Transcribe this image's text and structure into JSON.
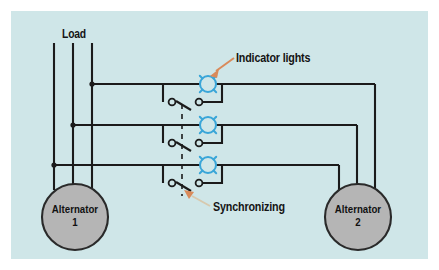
{
  "figure": {
    "kind": "electrical-schematic",
    "title_visible": false,
    "panel_background": "#cfe6e8",
    "outer_background": "#ffffff",
    "wire_color": "#1b1b1b",
    "lamp_color": "#3aa6d8",
    "callout_color": "#d98a5a",
    "machine_fill": "#b5b5b5",
    "machine_stroke": "#2a2a2a"
  },
  "labels": {
    "load": "Load",
    "indicator_lights": "Indicator lights",
    "synchronizing": "Synchronizing"
  },
  "machines": [
    {
      "id": "alternator-1",
      "name": "Alternator",
      "number": "1",
      "cx": 75,
      "cy": 217,
      "r": 33
    },
    {
      "id": "alternator-2",
      "name": "Alternator",
      "number": "2",
      "cx": 358,
      "cy": 217,
      "r": 33
    }
  ],
  "buses": [
    {
      "id": "phase-1",
      "y": 84,
      "left_x": 92,
      "right_x": 375
    },
    {
      "id": "phase-2",
      "y": 125,
      "left_x": 73,
      "right_x": 357
    },
    {
      "id": "phase-3",
      "y": 165,
      "left_x": 54,
      "right_x": 339
    }
  ],
  "left_feeders": [
    {
      "id": "load-line-1",
      "x": 54,
      "y_top": 43,
      "y_bottom": 190
    },
    {
      "id": "load-line-2",
      "x": 73,
      "y_top": 43,
      "y_bottom": 190
    },
    {
      "id": "load-line-3",
      "x": 92,
      "y_top": 43,
      "y_bottom": 190
    }
  ],
  "lamps": [
    {
      "id": "indicator-lamp-1",
      "cx": 208,
      "cy": 84,
      "r": 8
    },
    {
      "id": "indicator-lamp-2",
      "cx": 208,
      "cy": 125,
      "r": 8
    },
    {
      "id": "indicator-lamp-3",
      "cx": 208,
      "cy": 165,
      "r": 8
    }
  ],
  "switches": [
    {
      "id": "sync-switch-1",
      "left_cx": 173,
      "right_cx": 193,
      "cy": 102
    },
    {
      "id": "sync-switch-2",
      "left_cx": 173,
      "right_cx": 193,
      "cy": 143
    },
    {
      "id": "sync-switch-3",
      "left_cx": 173,
      "right_cx": 193,
      "cy": 183
    }
  ],
  "linkage": {
    "id": "mechanical-linkage",
    "x": 182,
    "y_top": 103,
    "y_bottom": 196,
    "style": "dashed"
  },
  "callouts": [
    {
      "id": "indicator-lights-callout",
      "label_key": "indicator_lights",
      "arrow_from_x": 232,
      "arrow_from_y": 59,
      "arrow_to_x": 211,
      "arrow_to_y": 74
    },
    {
      "id": "synchronizing-callout",
      "label_key": "synchronizing",
      "arrow_from_x": 208,
      "arrow_from_y": 206,
      "arrow_to_x": 185,
      "arrow_to_y": 190
    }
  ]
}
